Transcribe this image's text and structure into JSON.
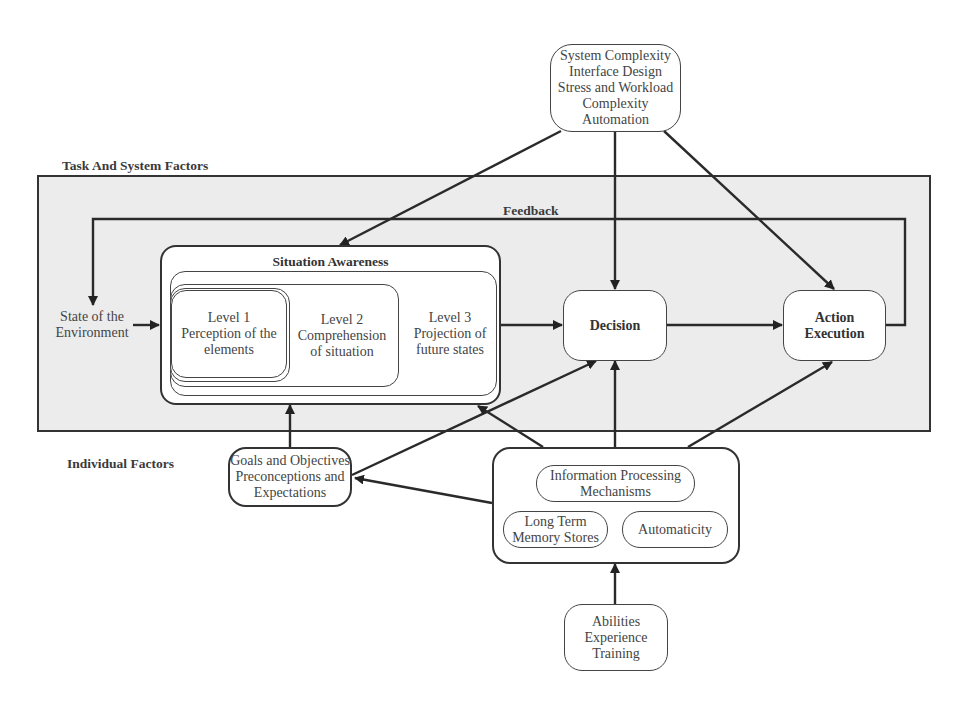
{
  "diagram": {
    "type": "flow-model",
    "regions": {
      "task_system": {
        "label": "Task And System Factors"
      },
      "individual": {
        "label": "Individual Factors"
      }
    },
    "nodes": {
      "task_factors": {
        "lines": [
          "System Complexity",
          "Interface Design",
          "Stress and Workload",
          "Complexity",
          "Automation"
        ]
      },
      "state": {
        "lines": [
          "State of the",
          "Environment"
        ]
      },
      "situation_awareness": {
        "title": "Situation Awareness",
        "level1": {
          "lines": [
            "Level 1",
            "Perception of the",
            "elements"
          ]
        },
        "level2": {
          "lines": [
            "Level 2",
            "Comprehension",
            "of situation"
          ]
        },
        "level3": {
          "lines": [
            "Level 3",
            "Projection of",
            "future states"
          ]
        }
      },
      "decision": {
        "label": "Decision"
      },
      "action": {
        "lines": [
          "Action",
          "Execution"
        ]
      },
      "goals": {
        "lines": [
          "Goals and Objectives",
          "Preconceptions and",
          "Expectations"
        ]
      },
      "individual_box": {
        "info_processing": {
          "lines": [
            "Information Processing",
            "Mechanisms"
          ]
        },
        "long_term_memory": {
          "lines": [
            "Long Term",
            "Memory Stores"
          ]
        },
        "automaticity": {
          "label": "Automaticity"
        }
      },
      "abilities": {
        "lines": [
          "Abilities",
          "Experience",
          "Training"
        ]
      }
    },
    "edges": {
      "feedback_label": "Feedback",
      "list": [
        [
          "task_factors",
          "situation_awareness"
        ],
        [
          "task_factors",
          "decision"
        ],
        [
          "task_factors",
          "action"
        ],
        [
          "state",
          "situation_awareness"
        ],
        [
          "situation_awareness",
          "decision"
        ],
        [
          "decision",
          "action"
        ],
        [
          "action",
          "state",
          "feedback"
        ],
        [
          "goals",
          "situation_awareness"
        ],
        [
          "goals",
          "decision"
        ],
        [
          "individual_box",
          "goals"
        ],
        [
          "individual_box",
          "situation_awareness"
        ],
        [
          "individual_box",
          "decision"
        ],
        [
          "individual_box",
          "action"
        ],
        [
          "abilities",
          "individual_box"
        ]
      ]
    },
    "colors": {
      "panel_fill": "#ececec",
      "stroke": "#333333",
      "text": "#444444"
    }
  }
}
